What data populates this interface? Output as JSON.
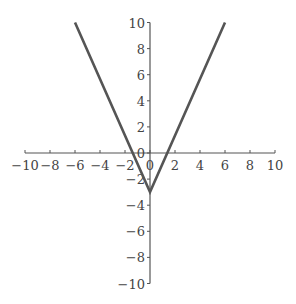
{
  "chart_data": {
    "type": "line",
    "title": "",
    "xlabel": "",
    "ylabel": "",
    "xlim": [
      -10,
      10
    ],
    "ylim": [
      -10,
      10
    ],
    "grid": false,
    "legend": null,
    "x_ticks": [
      -10,
      -8,
      -6,
      -4,
      -2,
      0,
      2,
      4,
      6,
      8,
      10
    ],
    "y_ticks": [
      -10,
      -8,
      -6,
      -4,
      -2,
      0,
      2,
      4,
      6,
      8,
      10
    ],
    "x_tick_labels": [
      "−10",
      "−8",
      "−6",
      "−4",
      "−2",
      "0",
      "2",
      "4",
      "6",
      "8",
      "10"
    ],
    "y_tick_labels": [
      "−10",
      "−8",
      "−6",
      "−4",
      "−2",
      "0",
      "2",
      "4",
      "6",
      "8",
      "10"
    ],
    "series": [
      {
        "name": "absolute value function",
        "color": "#555555",
        "x": [
          -6,
          0,
          6
        ],
        "y": [
          10,
          -3,
          10
        ]
      }
    ]
  },
  "colors": {
    "axis": "#555555",
    "line": "#555555",
    "text": "#444444"
  }
}
